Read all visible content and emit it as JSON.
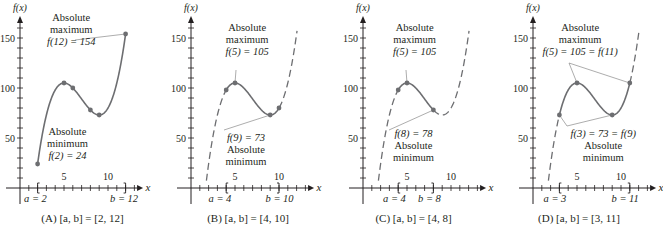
{
  "chart_data": [
    {
      "type": "line",
      "panel": "A",
      "title": "(A) [a, b] = [2, 12]",
      "xlabel": "x",
      "ylabel": "f(x)",
      "function": "f(x) = x^3 - 21x^2 + 135x - 170",
      "interval": [
        2,
        12
      ],
      "x_ticks": [
        5,
        10
      ],
      "y_ticks": [
        50,
        100,
        150
      ],
      "xlim": [
        0,
        13.5
      ],
      "ylim": [
        0,
        170
      ],
      "marked_points": [
        {
          "x": 2,
          "y": 24
        },
        {
          "x": 5,
          "y": 105
        },
        {
          "x": 6,
          "y": 100
        },
        {
          "x": 8,
          "y": 78
        },
        {
          "x": 9,
          "y": 73
        },
        {
          "x": 12,
          "y": 154
        }
      ],
      "annotations": [
        {
          "text": "Absolute maximum f(12) = 154",
          "x": 12,
          "y": 154
        },
        {
          "text": "Absolute minimum f(2) = 24",
          "x": 2,
          "y": 24
        }
      ],
      "endpoint_labels": [
        "a = 2",
        "b = 12"
      ]
    },
    {
      "type": "line",
      "panel": "B",
      "title": "(B) [a, b] = [4, 10]",
      "xlabel": "x",
      "ylabel": "f(x)",
      "interval": [
        4,
        10
      ],
      "x_ticks": [
        5,
        10
      ],
      "y_ticks": [
        50,
        100,
        150
      ],
      "marked_points": [
        {
          "x": 4,
          "y": 98
        },
        {
          "x": 5,
          "y": 105
        },
        {
          "x": 9,
          "y": 73
        },
        {
          "x": 10,
          "y": 80
        }
      ],
      "annotations": [
        {
          "text": "Absolute maximum f(5) = 105",
          "x": 5,
          "y": 105
        },
        {
          "text": "f(9) = 73 Absolute minimum",
          "x": 9,
          "y": 73
        }
      ],
      "endpoint_labels": [
        "a = 4",
        "b = 10"
      ]
    },
    {
      "type": "line",
      "panel": "C",
      "title": "(C) [a, b] = [4, 8]",
      "xlabel": "x",
      "ylabel": "f(x)",
      "interval": [
        4,
        8
      ],
      "x_ticks": [
        5,
        10
      ],
      "y_ticks": [
        50,
        100,
        150
      ],
      "marked_points": [
        {
          "x": 4,
          "y": 98
        },
        {
          "x": 5,
          "y": 105
        },
        {
          "x": 8,
          "y": 78
        }
      ],
      "annotations": [
        {
          "text": "Absolute maximum f(5) = 105",
          "x": 5,
          "y": 105
        },
        {
          "text": "f(8) = 78 Absolute minimum",
          "x": 8,
          "y": 78
        }
      ],
      "endpoint_labels": [
        "a = 4",
        "b = 8"
      ]
    },
    {
      "type": "line",
      "panel": "D",
      "title": "(D) [a, b] = [3, 11]",
      "xlabel": "x",
      "ylabel": "f(x)",
      "interval": [
        3,
        11
      ],
      "x_ticks": [
        5,
        10
      ],
      "y_ticks": [
        50,
        100,
        150
      ],
      "marked_points": [
        {
          "x": 3,
          "y": 73
        },
        {
          "x": 5,
          "y": 105
        },
        {
          "x": 9,
          "y": 73
        },
        {
          "x": 11,
          "y": 105
        }
      ],
      "annotations": [
        {
          "text": "Absolute maximum f(5) = 105 = f(11)",
          "x": [
            5,
            11
          ],
          "y": 105
        },
        {
          "text": "f(3) = 73 = f(9) Absolute minimum",
          "x": [
            3,
            9
          ],
          "y": 73
        }
      ],
      "endpoint_labels": [
        "a = 3",
        "b = 11"
      ]
    }
  ],
  "panels": [
    {
      "caption": "(A)  [a, b] = [2, 12]",
      "a_label": "a = 2",
      "b_label": "b = 12",
      "ann1": [
        "Absolute",
        "maximum",
        "f(12) = 154"
      ],
      "ann2": [
        "Absolute",
        "minimum",
        "f(2) = 24"
      ]
    },
    {
      "caption": "(B)  [a, b] = [4, 10]",
      "a_label": "a = 4",
      "b_label": "b = 10",
      "ann1": [
        "Absolute",
        "maximum",
        "f(5) = 105"
      ],
      "ann2": [
        "f(9) = 73",
        "Absolute",
        "minimum"
      ]
    },
    {
      "caption": "(C)  [a, b] = [4, 8]",
      "a_label": "a = 4",
      "b_label": "b = 8",
      "ann1": [
        "Absolute",
        "maximum",
        "f(5) = 105"
      ],
      "ann2": [
        "f(8) = 78",
        "Absolute",
        "minimum"
      ]
    },
    {
      "caption": "(D)  [a, b] = [3, 11]",
      "a_label": "a = 3",
      "b_label": "b = 11",
      "ann1": [
        "Absolute",
        "maximum",
        "f(5) = 105 = f(11)"
      ],
      "ann2": [
        "f(3) = 73 = f(9)",
        "Absolute",
        "minimum"
      ]
    }
  ],
  "axis": {
    "y_label": "f(x)",
    "x_label": "x",
    "tick_5": "5",
    "tick_10": "10",
    "y50": "50",
    "y100": "100",
    "y150": "150"
  },
  "colors": {
    "curve": "#6d6e71",
    "point": "#6d6e71",
    "axis": "#231f20",
    "leader": "#8a8a8a"
  }
}
